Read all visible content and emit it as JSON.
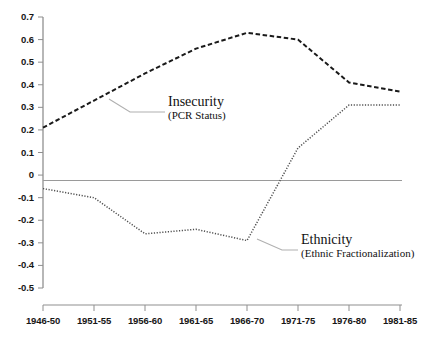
{
  "chart_data": {
    "type": "line",
    "title": "",
    "xlabel": "",
    "ylabel": "",
    "x": [
      "1946-50",
      "1951-55",
      "1956-60",
      "1961-65",
      "1966-70",
      "1971-75",
      "1976-80",
      "1981-85"
    ],
    "categories": [
      "1946-50",
      "1951-55",
      "1956-60",
      "1961-65",
      "1966-70",
      "1971-75",
      "1976-80",
      "1981-85"
    ],
    "ylim": [
      -0.5,
      0.7
    ],
    "xlim": [
      0,
      7
    ],
    "grid": false,
    "zero_line": true,
    "legend_position": "inline-annotation",
    "ytick_labels": [
      "0.7",
      "0.6",
      "0.5",
      "0.4",
      "0.3",
      "0.2",
      "0.1",
      "0",
      "-0.1",
      "-0.2",
      "-0.3",
      "-0.4",
      "-0.5"
    ],
    "ytick_values": [
      0.7,
      0.6,
      0.5,
      0.4,
      0.3,
      0.2,
      0.1,
      0.0,
      -0.1,
      -0.2,
      -0.3,
      -0.4,
      -0.5
    ],
    "series": [
      {
        "name": "Insecurity",
        "sublabel": "(PCR Status)",
        "style": "dashed",
        "color": "#1a1a1a",
        "values": [
          0.21,
          0.33,
          0.45,
          0.56,
          0.63,
          0.6,
          0.41,
          0.37
        ]
      },
      {
        "name": "Ethnicity",
        "sublabel": "(Ethnic Fractionalization)",
        "style": "dotted",
        "color": "#4f4f4f",
        "values": [
          -0.06,
          -0.1,
          -0.26,
          -0.24,
          -0.29,
          0.12,
          0.31,
          0.31
        ]
      }
    ]
  },
  "annotations": {
    "insecurity": {
      "title": "Insecurity",
      "subtitle": "(PCR Status)"
    },
    "ethnicity": {
      "title": "Ethnicity",
      "subtitle": "(Ethnic Fractionalization)"
    }
  }
}
